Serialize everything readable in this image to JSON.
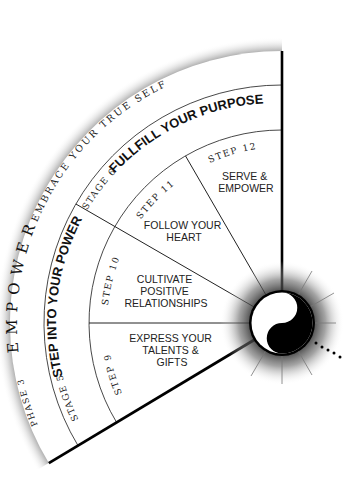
{
  "diagram": {
    "phase": {
      "number_label": "PHASE 3",
      "name": "EMPOWER",
      "tagline": "EMBRACE YOUR TRUE SELF"
    },
    "stages": [
      {
        "number_label": "STAGE 5",
        "title": "STEP INTO YOUR POWER"
      },
      {
        "number_label": "STAGE 6",
        "title": "FULLFILL YOUR PURPOSE"
      }
    ],
    "steps": [
      {
        "number_label": "STEP 9",
        "lines": [
          "EXPRESS YOUR",
          "TALENTS &",
          "GIFTS"
        ]
      },
      {
        "number_label": "STEP 10",
        "lines": [
          "CULTIVATE",
          "POSITIVE",
          "RELATIONSHIPS"
        ]
      },
      {
        "number_label": "STEP 11",
        "lines": [
          "FOLLOW YOUR",
          "HEART"
        ]
      },
      {
        "number_label": "STEP 12",
        "lines": [
          "SERVE &",
          "EMPOWER"
        ]
      }
    ],
    "center_symbol": "yin-yang-icon",
    "colors": {
      "background": "#ffffff",
      "line": "#111111",
      "thin_line": "#444444",
      "shadow": "#7a7a7a"
    }
  }
}
